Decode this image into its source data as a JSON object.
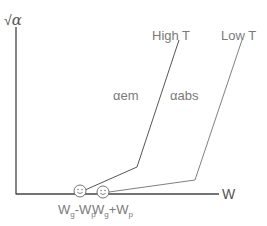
{
  "diagram": {
    "y_axis": {
      "label_prefix": "√",
      "label_symbol": "α"
    },
    "x_axis": {
      "label": "W"
    },
    "curves": [
      {
        "name": "High T",
        "label": "High T",
        "series_label": "αem",
        "color": "#555555"
      },
      {
        "name": "Low T",
        "label": "Low T",
        "series_label": "αabs",
        "color": "#777777"
      }
    ],
    "markers": [
      {
        "icon": "smiley-icon",
        "label_main1": "W",
        "label_sub1": "g",
        "label_op": "-",
        "label_main2": "W",
        "label_sub2": "p"
      },
      {
        "icon": "smiley-icon",
        "label_main1": "W",
        "label_sub1": "g",
        "label_op": "+",
        "label_main2": "W",
        "label_sub2": "p"
      }
    ],
    "colors": {
      "axis": "#444444",
      "high_t": "#555555",
      "low_t": "#808080",
      "text": "#7a7a7a"
    }
  }
}
